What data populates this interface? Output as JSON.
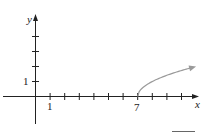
{
  "chart_data": {
    "type": "line",
    "title": "",
    "xlabel": "x",
    "ylabel": "y",
    "function": "y = sqrt(x - 7)",
    "x_tick_labels": [
      {
        "value": 1,
        "label": "1"
      },
      {
        "value": 7,
        "label": "7"
      }
    ],
    "y_tick_labels": [
      {
        "value": 1,
        "label": "1"
      }
    ],
    "x_ticks": [
      1,
      2,
      3,
      4,
      5,
      6,
      7,
      8,
      9,
      10
    ],
    "y_ticks": [
      1,
      2,
      3,
      4
    ],
    "xlim": [
      -0.8,
      11.2
    ],
    "ylim": [
      -1.8,
      5.5
    ],
    "series": [
      {
        "name": "curve",
        "x": [
          7,
          7.25,
          7.5,
          8,
          8.5,
          9,
          9.5,
          10,
          10.5,
          10.8
        ],
        "y": [
          0,
          0.5,
          0.71,
          1,
          1.22,
          1.41,
          1.58,
          1.73,
          1.87,
          1.95
        ],
        "color": "#9a9a9a",
        "arrow_end": true
      }
    ],
    "grid": false
  },
  "labels": {
    "x_axis": "x",
    "y_axis": "y",
    "tick_x1": "1",
    "tick_x7": "7",
    "tick_y1": "1"
  }
}
